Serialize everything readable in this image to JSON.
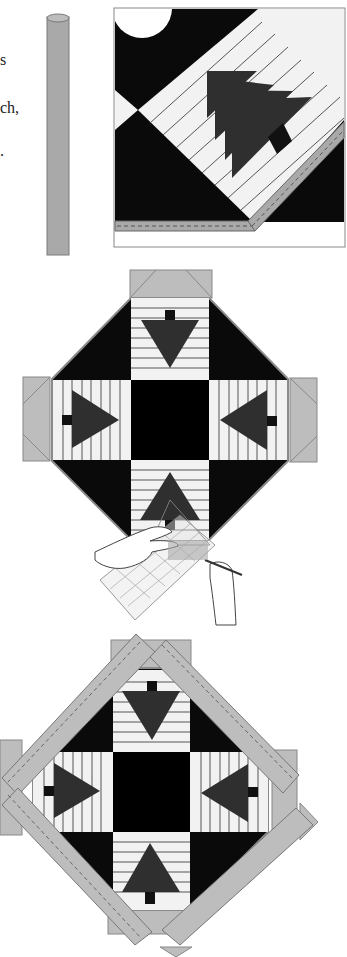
{
  "page": {
    "type": "quilting instruction illustration"
  },
  "left_text_fragments": [
    {
      "text": "s",
      "top": 52
    },
    {
      "text": "ch,",
      "top": 100
    },
    {
      "text": ".",
      "top": 143
    }
  ],
  "figures": [
    {
      "id": "step-1",
      "label": "Binding strip and corner detail of tree block with stitched binding"
    },
    {
      "id": "step-2",
      "label": "Square-on-point assembly with corner triangles being trimmed with ruler and rotary cutter"
    },
    {
      "id": "step-3",
      "label": "Finished block with border strips sewn on all four sides"
    }
  ],
  "colors": {
    "background": "#FFFFFF",
    "black_fabric": "#0A0A0A",
    "tree_fabric": "#2F2F2F",
    "light_fabric": "#F2F2F2",
    "strip_gray": "#A9A9A9",
    "binding_gray": "#BDBDBD",
    "outline": "#6E6E6E"
  }
}
